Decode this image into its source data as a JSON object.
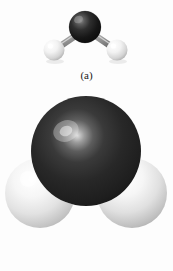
{
  "figure": {
    "background_color": "#fdfdfd",
    "panels": [
      {
        "id": "a",
        "caption": "(a)",
        "model_type": "ball-and-stick",
        "atoms": [
          {
            "element": "O",
            "role": "central",
            "color": "#1c1c1c",
            "highlight_color": "#8d8d8d",
            "cx": 85,
            "cy": 27,
            "r": 16
          },
          {
            "element": "H",
            "role": "terminal-left",
            "color": "#f4f4f4",
            "highlight_color": "#ffffff",
            "cx": 54,
            "cy": 50,
            "r": 10.5
          },
          {
            "element": "H",
            "role": "terminal-right",
            "color": "#f4f4f4",
            "highlight_color": "#ffffff",
            "cx": 117,
            "cy": 50,
            "r": 10.5
          }
        ],
        "bonds": [
          {
            "from": "O",
            "to": "H-left",
            "color": "#9a9a9a"
          },
          {
            "from": "O",
            "to": "H-right",
            "color": "#9a9a9a"
          }
        ]
      },
      {
        "id": "b",
        "caption": "(b)",
        "model_type": "space-filling",
        "atoms": [
          {
            "element": "O",
            "role": "central",
            "color": "#262626",
            "highlight_color": "#c8c8c8",
            "cx": 86,
            "cy": 58,
            "r": 55
          },
          {
            "element": "H",
            "role": "terminal-left",
            "color": "#e8e8e8",
            "highlight_color": "#ffffff",
            "cx": 40,
            "cy": 100,
            "r": 35
          },
          {
            "element": "H",
            "role": "terminal-right",
            "color": "#e8e8e8",
            "highlight_color": "#ffffff",
            "cx": 132,
            "cy": 100,
            "r": 35
          }
        ]
      }
    ]
  }
}
